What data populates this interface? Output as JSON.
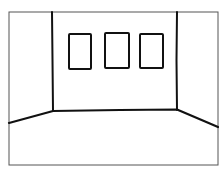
{
  "scene": {
    "description": "Hand-drawn line sketch of an empty room viewed from the front with three picture frames on the back wall",
    "colors": {
      "background": "#ffffff",
      "ink": "#111111",
      "border": "#555555"
    },
    "frames_count": 3
  }
}
